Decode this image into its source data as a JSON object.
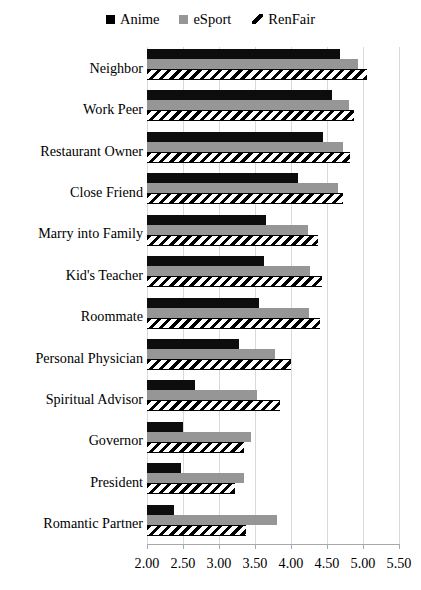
{
  "chart_data": {
    "type": "bar",
    "orientation": "horizontal",
    "title": "",
    "xlabel": "",
    "ylabel": "",
    "xlim": [
      2.0,
      5.5
    ],
    "xticks": [
      "2.00",
      "2.50",
      "3.00",
      "3.50",
      "4.00",
      "4.50",
      "5.00",
      "5.50"
    ],
    "xtick_values": [
      2.0,
      2.5,
      3.0,
      3.5,
      4.0,
      4.5,
      5.0,
      5.5
    ],
    "grid": true,
    "legend_position": "top-center",
    "categories": [
      "Neighbor",
      "Work Peer",
      "Restaurant Owner",
      "Close Friend",
      "Marry into Family",
      "Kid's Teacher",
      "Roommate",
      "Personal Physician",
      "Spiritual Advisor",
      "Governor",
      "President",
      "Romantic Partner"
    ],
    "series": [
      {
        "name": "Anime",
        "color": "#0d0d0d",
        "values": [
          4.68,
          4.57,
          4.45,
          4.1,
          3.65,
          3.63,
          3.55,
          3.28,
          2.67,
          2.5,
          2.47,
          2.38
        ]
      },
      {
        "name": "eSport",
        "color": "#969696",
        "values": [
          4.93,
          4.8,
          4.72,
          4.65,
          4.23,
          4.27,
          4.25,
          3.78,
          3.53,
          3.45,
          3.35,
          3.8
        ]
      },
      {
        "name": "RenFair",
        "color": "#000000",
        "pattern": "diagonal-hatch",
        "values": [
          5.05,
          4.88,
          4.82,
          4.72,
          4.38,
          4.43,
          4.4,
          4.0,
          3.85,
          3.35,
          3.22,
          3.38
        ]
      }
    ]
  },
  "legend": {
    "items": [
      {
        "label": "Anime",
        "icon": "black-square-swatch"
      },
      {
        "label": "eSport",
        "icon": "gray-square-swatch"
      },
      {
        "label": "RenFair",
        "icon": "hatch-swatch"
      }
    ]
  }
}
